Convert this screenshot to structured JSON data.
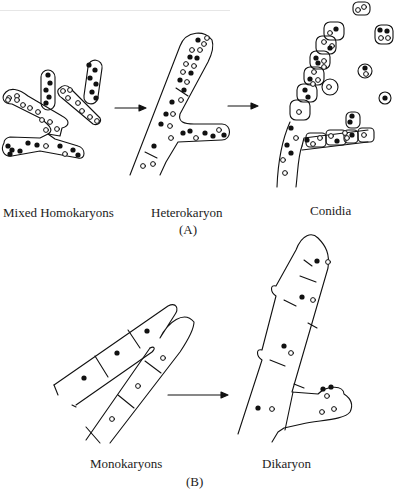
{
  "figure": {
    "panel_a": {
      "label": "(A)",
      "stages": [
        {
          "name": "Mixed Homokaryons"
        },
        {
          "name": "Heterokaryon"
        },
        {
          "name": "Conidia"
        }
      ]
    },
    "panel_b": {
      "label": "(B)",
      "stages": [
        {
          "name": "Monokaryons"
        },
        {
          "name": "Dikaryon"
        }
      ]
    },
    "legend_semantics": {
      "filled_nucleus": "nucleus type 1 (black)",
      "open_nucleus": "nucleus type 2 (white)"
    },
    "colors": {
      "ink": "#111111",
      "background": "#ffffff"
    }
  }
}
